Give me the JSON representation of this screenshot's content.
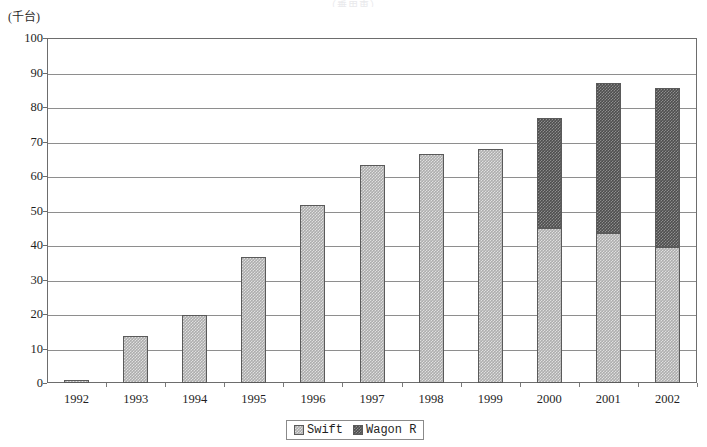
{
  "title_faint": "（乗用車）",
  "unit_label": "(千台)",
  "chart_data": {
    "type": "bar",
    "stacked": true,
    "title": "",
    "subtitle": "",
    "xlabel": "",
    "ylabel": "(千台)",
    "ylim": [
      0,
      100
    ],
    "ytick_step": 10,
    "yticks": [
      "0",
      "10",
      "20",
      "30",
      "40",
      "50",
      "60",
      "70",
      "80",
      "90",
      "100"
    ],
    "grid": true,
    "legend_position": "bottom-center",
    "categories": [
      "1992",
      "1993",
      "1994",
      "1995",
      "1996",
      "1997",
      "1998",
      "1999",
      "2000",
      "2001",
      "2002"
    ],
    "series": [
      {
        "name": "Swift",
        "color": "#adadad",
        "values": [
          0.8,
          13.7,
          19.7,
          36.4,
          51.6,
          63.3,
          66.3,
          67.7,
          45.0,
          43.5,
          39.3
        ]
      },
      {
        "name": "Wagon R",
        "color": "#4e4e4e",
        "values": [
          0,
          0,
          0,
          0,
          0,
          0,
          0,
          0,
          31.8,
          43.5,
          46.3
        ]
      }
    ],
    "totals": [
      0.8,
      13.7,
      19.7,
      36.4,
      51.6,
      63.3,
      66.3,
      67.7,
      76.8,
      87.0,
      85.6
    ]
  },
  "legend": {
    "items": [
      {
        "label": "Swift",
        "color": "#adadad"
      },
      {
        "label": "Wagon R",
        "color": "#4e4e4e"
      }
    ]
  }
}
